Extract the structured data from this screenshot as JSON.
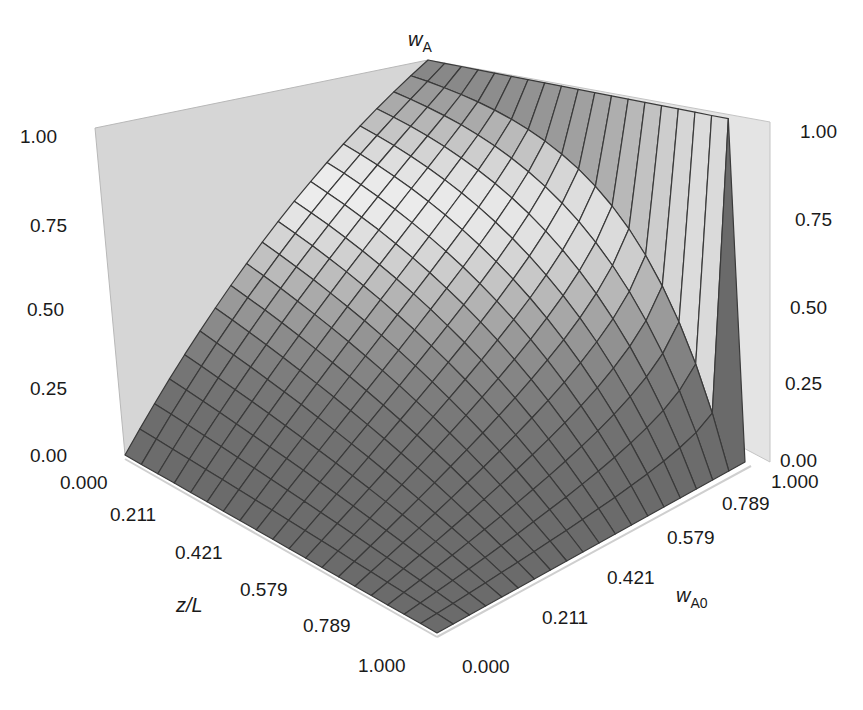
{
  "chart_data": {
    "type": "surface3d",
    "title": "",
    "function_description": "1 - wA = (1 - wA0)^(1 - z/L)",
    "x_axis": {
      "label": "z/L",
      "range": [
        0,
        1
      ],
      "ticks": [
        "0.000",
        "0.211",
        "0.421",
        "0.579",
        "0.789",
        "1.000"
      ]
    },
    "y_axis": {
      "label": "w",
      "label_sub": "A0",
      "range": [
        0,
        1
      ],
      "ticks": [
        "0.000",
        "0.211",
        "0.421",
        "0.579",
        "0.789",
        "1.000"
      ]
    },
    "z_axis": {
      "label": "w",
      "label_sub": "A",
      "range": [
        0,
        1
      ],
      "ticks": [
        "0.00",
        "0.25",
        "0.50",
        "0.75",
        "1.00"
      ]
    },
    "grid_points": 20,
    "colors": {
      "mesh": "#3a3a3a",
      "wall": "#d6d6d6",
      "surface_dark": "#6a6a6a",
      "surface_light": "#f4f4f4"
    }
  }
}
